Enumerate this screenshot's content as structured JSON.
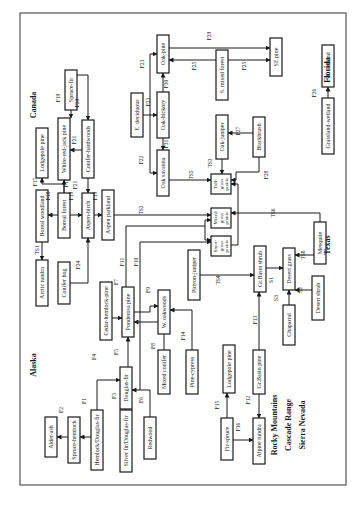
{
  "diagram": {
    "orientation": "rotated-90-clockwise",
    "regions": [
      {
        "id": "canada",
        "label": "Canada",
        "x": 36,
        "y": 105
      },
      {
        "id": "florida",
        "label": "Florida",
        "x": 330,
        "y": 70
      },
      {
        "id": "alaska",
        "label": "Alaska",
        "x": 36,
        "y": 365
      },
      {
        "id": "texas",
        "label": "Texas",
        "x": 330,
        "y": 245
      },
      {
        "id": "rocky",
        "label": "Rocky Mountains",
        "x": 277,
        "y": 425
      },
      {
        "id": "cascade",
        "label": "Cascade Range",
        "x": 291,
        "y": 425
      },
      {
        "id": "sierra",
        "label": "Sierra Nevada",
        "x": 305,
        "y": 425
      }
    ],
    "nodes": [
      {
        "id": "spruce-fir",
        "label": "Spruce-fir",
        "x": 65,
        "y": 70,
        "w": 12,
        "h": 40
      },
      {
        "id": "lodgepole-pine-ca",
        "label": "Lodgepole pine",
        "x": 36,
        "y": 128,
        "w": 12,
        "h": 50
      },
      {
        "id": "white-red-jack-pine",
        "label": "White-red-jack pine",
        "x": 58,
        "y": 118,
        "w": 12,
        "h": 62
      },
      {
        "id": "conifer-hardwoods",
        "label": "Conifer-hardwoods",
        "x": 82,
        "y": 120,
        "w": 12,
        "h": 58
      },
      {
        "id": "boreal-woodland",
        "label": "Boreal woodland",
        "x": 36,
        "y": 190,
        "w": 12,
        "h": 52
      },
      {
        "id": "boreal-forest",
        "label": "Boreal forest",
        "x": 58,
        "y": 193,
        "w": 12,
        "h": 45
      },
      {
        "id": "aspen-birch",
        "label": "Aspen-birch",
        "x": 82,
        "y": 193,
        "w": 12,
        "h": 45
      },
      {
        "id": "aspen-parkland",
        "label": "Aspen parkland",
        "x": 102,
        "y": 190,
        "w": 12,
        "h": 50
      },
      {
        "id": "arctic-tundra",
        "label": "Arctic tundra",
        "x": 36,
        "y": 260,
        "w": 12,
        "h": 46
      },
      {
        "id": "conifer-bog",
        "label": "Conifer bog",
        "x": 58,
        "y": 262,
        "w": 12,
        "h": 42
      },
      {
        "id": "e-deciduous",
        "label": "E. deciduous",
        "x": 131,
        "y": 93,
        "w": 12,
        "h": 44
      },
      {
        "id": "oak-pine",
        "label": "Oak-pine",
        "x": 157,
        "y": 35,
        "w": 12,
        "h": 38
      },
      {
        "id": "oak-hickory",
        "label": "Oak-hickory",
        "x": 157,
        "y": 92,
        "w": 12,
        "h": 46
      },
      {
        "id": "oak-savanna",
        "label": "Oak savanna",
        "x": 157,
        "y": 150,
        "w": 12,
        "h": 46
      },
      {
        "id": "s-mixed-forest",
        "label": "S. mixed forest",
        "x": 216,
        "y": 50,
        "w": 12,
        "h": 50
      },
      {
        "id": "se-pine",
        "label": "SE pine",
        "x": 270,
        "y": 38,
        "w": 12,
        "h": 38
      },
      {
        "id": "se-wetland",
        "label": "SE wetland",
        "x": 322,
        "y": 45,
        "w": 12,
        "h": 42
      },
      {
        "id": "grassland-wetland",
        "label": "Grassland-wetland",
        "x": 322,
        "y": 98,
        "w": 12,
        "h": 56
      },
      {
        "id": "oak-juniper",
        "label": "Oak-juniper",
        "x": 216,
        "y": 115,
        "w": 12,
        "h": 44
      },
      {
        "id": "blackbrush",
        "label": "Blackbrush",
        "x": 253,
        "y": 117,
        "w": 12,
        "h": 40
      },
      {
        "id": "tall-grass-prairie",
        "label": "Tall- grass prairie",
        "x": 211,
        "y": 174,
        "w": 20,
        "h": 20
      },
      {
        "id": "mixed-grass-prairie",
        "label": "Mixed grass prairie",
        "x": 211,
        "y": 208,
        "w": 20,
        "h": 20
      },
      {
        "id": "short-grass-prairie",
        "label": "Short- grass prairie",
        "x": 211,
        "y": 236,
        "w": 20,
        "h": 20
      },
      {
        "id": "mesquite",
        "label": "Mesquite",
        "x": 314,
        "y": 222,
        "w": 12,
        "h": 42
      },
      {
        "id": "pinyon-juniper",
        "label": "Pinyon-juniper",
        "x": 188,
        "y": 250,
        "w": 12,
        "h": 50
      },
      {
        "id": "gr-basin-shrub",
        "label": "Gr.Basin shrub",
        "x": 254,
        "y": 246,
        "w": 12,
        "h": 46
      },
      {
        "id": "desert-grass",
        "label": "Desert grass",
        "x": 283,
        "y": 248,
        "w": 12,
        "h": 42
      },
      {
        "id": "desert-shrub",
        "label": "Desert shrub",
        "x": 312,
        "y": 276,
        "w": 12,
        "h": 44
      },
      {
        "id": "chaparral",
        "label": "Chaparral",
        "x": 283,
        "y": 305,
        "w": 12,
        "h": 40
      },
      {
        "id": "cedar-hemlock-pine",
        "label": "Cedar-hemlock-pine",
        "x": 100,
        "y": 282,
        "w": 12,
        "h": 58
      },
      {
        "id": "ponderosa-pine",
        "label": "Ponderosa pine",
        "x": 122,
        "y": 287,
        "w": 12,
        "h": 50
      },
      {
        "id": "w-oakwoods",
        "label": "W. oakwoods",
        "x": 158,
        "y": 290,
        "w": 12,
        "h": 44
      },
      {
        "id": "mixed-conifer",
        "label": "Mixed conifer",
        "x": 158,
        "y": 350,
        "w": 12,
        "h": 44
      },
      {
        "id": "pine-cypress",
        "label": "Pine-cypress",
        "x": 186,
        "y": 350,
        "w": 12,
        "h": 44
      },
      {
        "id": "douglas-fir",
        "label": "Douglas-fir",
        "x": 120,
        "y": 367,
        "w": 12,
        "h": 42
      },
      {
        "id": "alder-ash",
        "label": "Alder-ash",
        "x": 45,
        "y": 417,
        "w": 12,
        "h": 40
      },
      {
        "id": "spruce-hemlock",
        "label": "Spruce-hemlock",
        "x": 68,
        "y": 417,
        "w": 12,
        "h": 46
      },
      {
        "id": "hemlock-douglas-fir",
        "label": "Hemlock/Douglas-fir",
        "x": 91,
        "y": 410,
        "w": 12,
        "h": 60
      },
      {
        "id": "silver-fir-douglas-fir",
        "label": "Silver fir/Douglas-fir",
        "x": 120,
        "y": 410,
        "w": 12,
        "h": 62
      },
      {
        "id": "redwood",
        "label": "Redwood",
        "x": 144,
        "y": 417,
        "w": 12,
        "h": 42
      },
      {
        "id": "lodgepole-pine-rm",
        "label": "Lodgepole pine",
        "x": 223,
        "y": 345,
        "w": 12,
        "h": 48
      },
      {
        "id": "fir-spruce",
        "label": "Fir-spruce",
        "x": 221,
        "y": 418,
        "w": 12,
        "h": 42
      },
      {
        "id": "gr-basin-pine",
        "label": "Gr.Basin pine",
        "x": 253,
        "y": 350,
        "w": 12,
        "h": 44
      },
      {
        "id": "alpine-tundra",
        "label": "Alpine tundra",
        "x": 253,
        "y": 418,
        "w": 12,
        "h": 46
      }
    ],
    "edge_labels": [
      {
        "t": "F1",
        "x": 86,
        "y": 401
      },
      {
        "t": "F2",
        "x": 63,
        "y": 410
      },
      {
        "t": "F3",
        "x": 116,
        "y": 396
      },
      {
        "t": "F4",
        "x": 96,
        "y": 357
      },
      {
        "t": "F5",
        "x": 118,
        "y": 352
      },
      {
        "t": "F6",
        "x": 143,
        "y": 400
      },
      {
        "t": "F7",
        "x": 118,
        "y": 282
      },
      {
        "t": "F8",
        "x": 155,
        "y": 346
      },
      {
        "t": "F9",
        "x": 150,
        "y": 290
      },
      {
        "t": "F10",
        "x": 138,
        "y": 262
      },
      {
        "t": "F11",
        "x": 124,
        "y": 262
      },
      {
        "t": "F12",
        "x": 250,
        "y": 400
      },
      {
        "t": "F13",
        "x": 257,
        "y": 320
      },
      {
        "t": "F14",
        "x": 185,
        "y": 336
      },
      {
        "t": "F15",
        "x": 219,
        "y": 405
      },
      {
        "t": "F16",
        "x": 240,
        "y": 427
      },
      {
        "t": "F17",
        "x": 37,
        "y": 182
      },
      {
        "t": "F17",
        "x": 68,
        "y": 183
      },
      {
        "t": "F18",
        "x": 50,
        "y": 196
      },
      {
        "t": "F19",
        "x": 73,
        "y": 196
      },
      {
        "t": "F19",
        "x": 97,
        "y": 196
      },
      {
        "t": "F19",
        "x": 60,
        "y": 98
      },
      {
        "t": "F20",
        "x": 79,
        "y": 103
      },
      {
        "t": "F21",
        "x": 76,
        "y": 140
      },
      {
        "t": "F21",
        "x": 77,
        "y": 185
      },
      {
        "t": "F22",
        "x": 143,
        "y": 160
      },
      {
        "t": "F23",
        "x": 144,
        "y": 64
      },
      {
        "t": "F23",
        "x": 150,
        "y": 102
      },
      {
        "t": "F24",
        "x": 80,
        "y": 265
      },
      {
        "t": "F25",
        "x": 196,
        "y": 66
      },
      {
        "t": "F25",
        "x": 246,
        "y": 66
      },
      {
        "t": "F26",
        "x": 316,
        "y": 93
      },
      {
        "t": "F27",
        "x": 240,
        "y": 131
      },
      {
        "t": "F28",
        "x": 268,
        "y": 175
      },
      {
        "t": "F29",
        "x": 211,
        "y": 36
      },
      {
        "t": "F30",
        "x": 168,
        "y": 84
      },
      {
        "t": "F31",
        "x": 168,
        "y": 144
      },
      {
        "t": "S1",
        "x": 273,
        "y": 280
      },
      {
        "t": "S2",
        "x": 302,
        "y": 290
      },
      {
        "t": "S3",
        "x": 278,
        "y": 298
      },
      {
        "t": "TS1",
        "x": 39,
        "y": 250
      },
      {
        "t": "TS2",
        "x": 143,
        "y": 210
      },
      {
        "t": "TS3",
        "x": 212,
        "y": 163
      },
      {
        "t": "TS4",
        "x": 220,
        "y": 280
      },
      {
        "t": "TS5",
        "x": 193,
        "y": 175
      },
      {
        "t": "TS6",
        "x": 275,
        "y": 213
      },
      {
        "t": "TS8",
        "x": 305,
        "y": 255
      }
    ]
  }
}
